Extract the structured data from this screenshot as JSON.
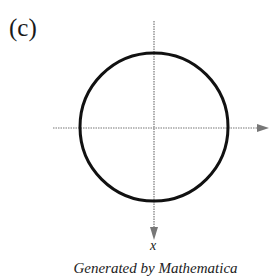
{
  "panel_label": "(c)",
  "axis_label": "x",
  "caption": "Generated by Mathematica",
  "diagram": {
    "type": "circle-on-axes",
    "circle": {
      "cx": 154,
      "cy": 127,
      "r": 74,
      "stroke": "#111111",
      "stroke_width": 3
    },
    "horizontal_axis": {
      "x1": 53,
      "x2": 258,
      "y": 128,
      "arrow": "right",
      "style": "dotted",
      "color": "#666666"
    },
    "vertical_axis": {
      "x": 154,
      "y1": 21,
      "y2": 230,
      "arrow": "down",
      "style": "dotted",
      "color": "#666666"
    }
  }
}
